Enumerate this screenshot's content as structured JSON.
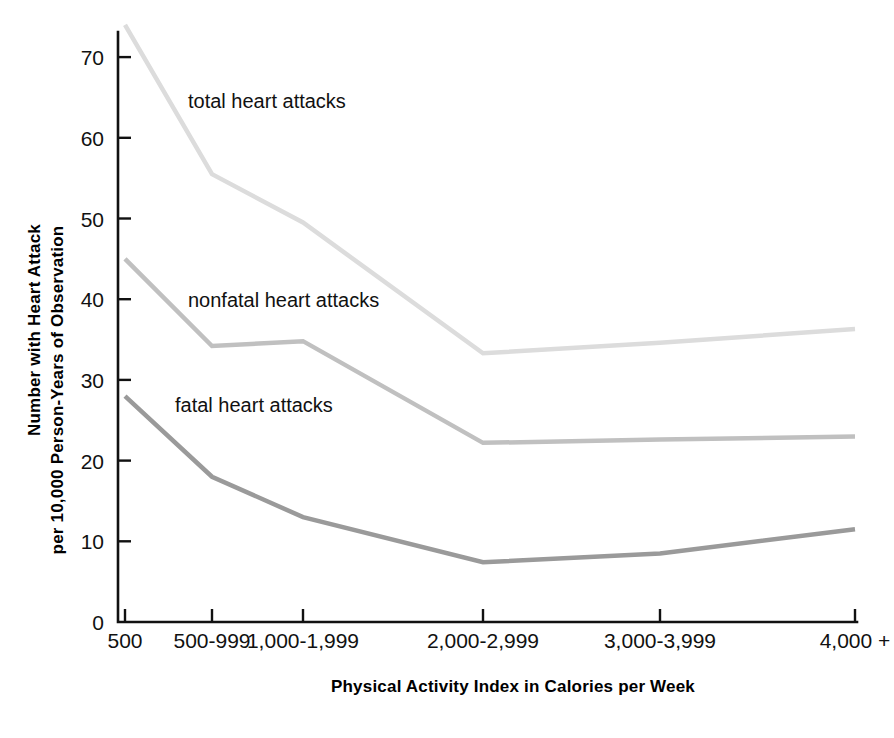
{
  "chart_data": {
    "type": "line",
    "title": "",
    "xlabel": "Physical Activity Index in Calories per Week",
    "ylabel_line1": "Number with Heart Attack",
    "ylabel_line2": "per 10,000 Person-Years of Observation",
    "categories": [
      "500",
      "500-999",
      "1,000-1,999",
      "2,000-2,999",
      "3,000-3,999",
      "4,000 +"
    ],
    "xtick_labels": [
      "500",
      "500-999",
      "1,000-1,999",
      "2,000-2,999",
      "3,000-3,999",
      "4,000 +"
    ],
    "ytick_labels": [
      "0",
      "10",
      "20",
      "30",
      "40",
      "50",
      "60",
      "70"
    ],
    "ytick_values": [
      0,
      10,
      20,
      30,
      40,
      50,
      60,
      70
    ],
    "ylim": [
      0,
      76
    ],
    "grid": false,
    "legend_position": "inline-labels",
    "series": [
      {
        "name": "total heart attacks",
        "label": "total heart attacks",
        "color": "#dcdcdc",
        "stroke_width": 4.5,
        "values": [
          74.0,
          55.5,
          49.5,
          33.3,
          34.6,
          36.3
        ],
        "label_x": 188,
        "label_y": 108
      },
      {
        "name": "nonfatal heart attacks",
        "label": "nonfatal heart attacks",
        "color": "#c0c0c0",
        "stroke_width": 4.5,
        "values": [
          45.0,
          34.2,
          34.8,
          22.2,
          22.6,
          23.0
        ],
        "label_x": 188,
        "label_y": 307
      },
      {
        "name": "fatal heart attacks",
        "label": "fatal heart attacks",
        "color": "#9a9a9a",
        "stroke_width": 4.5,
        "values": [
          28.0,
          18.0,
          13.0,
          7.4,
          8.5,
          11.5
        ],
        "label_x": 175,
        "label_y": 412
      }
    ]
  },
  "axes": {
    "x_tick_px": [
      125,
      212,
      303,
      483,
      660,
      855
    ],
    "x_axis_left_px": 118,
    "x_axis_right_px": 857,
    "baseline_px": 622,
    "top_px": 32,
    "y_zero_px": 622,
    "y_value_px_per_unit": 8.07
  },
  "colors": {
    "background": "#ffffff",
    "axis": "#111111",
    "text": "#000000",
    "total_series": "#dcdcdc",
    "nonfatal_series": "#c0c0c0",
    "fatal_series": "#9a9a9a"
  }
}
